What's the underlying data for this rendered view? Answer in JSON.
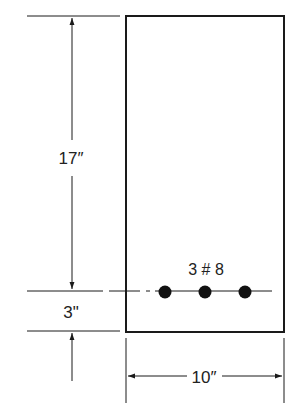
{
  "diagram": {
    "type": "reinforced concrete beam cross-section",
    "colors": {
      "line": "#1a1a1a",
      "background": "#ffffff"
    },
    "dimensions": {
      "effective_depth": "17″",
      "cover": "3\"",
      "width": "10″"
    },
    "reinforcement": {
      "label": "3 # 8",
      "bar_count": 3
    }
  }
}
